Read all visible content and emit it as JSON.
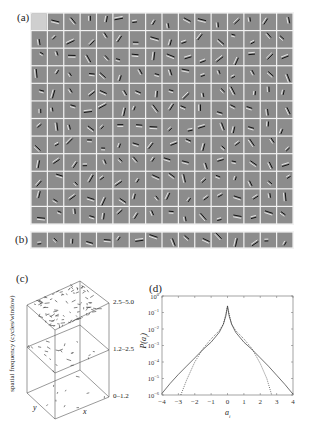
{
  "panels": {
    "a": {
      "label": "(a)",
      "rows": 12,
      "cols": 16,
      "grid": {
        "x": 31,
        "y": 13,
        "w": 262,
        "h": 211
      },
      "cell_bg": "#8a8a8a",
      "gap_color": "#f2f2f2"
    },
    "b": {
      "label": "(b)",
      "rows": 1,
      "cols": 16,
      "grid": {
        "x": 31,
        "y": 232,
        "w": 262,
        "h": 16
      }
    },
    "c": {
      "label": "(c)",
      "ylabel": "spatial frequency (cycles/window)",
      "x_axis": "x",
      "y_axis": "y",
      "bands": [
        "2.5–5.0",
        "1.2–2.5",
        "0–1.2"
      ],
      "feature_counts": [
        90,
        22,
        10
      ]
    },
    "d": {
      "label": "(d)",
      "ylabel": "P(a_i)",
      "xlabel": "a_i"
    }
  },
  "chart_data": {
    "type": "line",
    "title": "(d)",
    "xlabel": "a_i",
    "ylabel": "P(a_i)",
    "xlim": [
      -4,
      4
    ],
    "ylim_log10": [
      -6,
      0
    ],
    "yscale": "log",
    "x_ticks": [
      -4,
      -3,
      -2,
      -1,
      0,
      1,
      2,
      3,
      4
    ],
    "y_tick_labels": [
      "10^0",
      "10^-1",
      "10^-2",
      "10^-3",
      "10^-4",
      "10^-5",
      "10^-6"
    ],
    "grid": false,
    "series": [
      {
        "name": "empirical (solid)",
        "style": "solid",
        "x": [
          -4,
          -3.5,
          -3,
          -2.5,
          -2,
          -1.5,
          -1,
          -0.5,
          -0.25,
          -0.1,
          0,
          0.1,
          0.25,
          0.5,
          1,
          1.5,
          2,
          2.5,
          3,
          3.5,
          4
        ],
        "log10_y": [
          -5.9,
          -5.3,
          -4.75,
          -4.25,
          -3.75,
          -3.25,
          -2.8,
          -2.2,
          -1.7,
          -1.2,
          -0.6,
          -1.2,
          -1.7,
          -2.2,
          -2.8,
          -3.25,
          -3.75,
          -4.25,
          -4.8,
          -5.35,
          -5.95
        ]
      },
      {
        "name": "fitted (dotted)",
        "style": "dotted",
        "x": [
          -2.85,
          -2.5,
          -2,
          -1.5,
          -1,
          -0.5,
          -0.25,
          0,
          0.25,
          0.5,
          1,
          1.5,
          2,
          2.4,
          2.7
        ],
        "log10_y": [
          -6,
          -5.1,
          -4.0,
          -3.2,
          -2.6,
          -2.1,
          -1.7,
          -0.65,
          -1.7,
          -2.1,
          -2.6,
          -3.2,
          -4.1,
          -5.0,
          -6
        ]
      }
    ]
  }
}
